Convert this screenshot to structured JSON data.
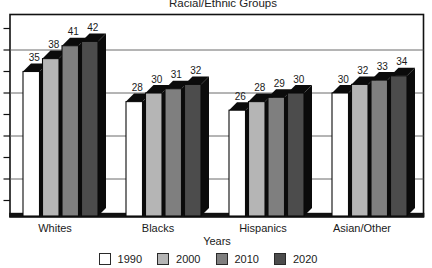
{
  "chart_data": {
    "type": "bar",
    "style": "3d-column",
    "title": "Racial/Ethnic Groups",
    "xlabel": "Years",
    "ylabel": "",
    "categories": [
      "Whites",
      "Blacks",
      "Hispanics",
      "Asian/Other"
    ],
    "series": [
      {
        "name": "1990",
        "color": "#ffffff",
        "values": [
          35,
          28,
          26,
          30
        ]
      },
      {
        "name": "2000",
        "color": "#b5b5b5",
        "values": [
          38,
          30,
          28,
          32
        ]
      },
      {
        "name": "2010",
        "color": "#7f7f7f",
        "values": [
          41,
          31,
          29,
          33
        ]
      },
      {
        "name": "2020",
        "color": "#4c4c4c",
        "values": [
          42,
          32,
          30,
          34
        ]
      }
    ],
    "ylim": [
      0,
      50
    ],
    "gridline_step": 10,
    "tick_step": 5,
    "y_tick_labels_visible": false,
    "grid": true,
    "legend_position": "bottom"
  },
  "colors": {
    "background": "#ffffff",
    "extrusion": "#0b0b0b",
    "axis": "#111111",
    "gridline": "#5a5a5a",
    "text": "#1a1a1a"
  }
}
